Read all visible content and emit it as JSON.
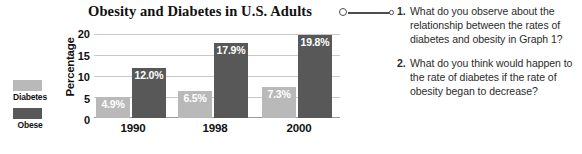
{
  "chart_data": {
    "type": "bar",
    "title": "Obesity and Diabetes in U.S. Adults",
    "xlabel": "",
    "ylabel": "Percentage",
    "ylim": [
      0,
      20
    ],
    "yticks": [
      "20",
      "15",
      "10",
      "5",
      "0"
    ],
    "grid": true,
    "legend_position": "left",
    "categories": [
      "1990",
      "1998",
      "2000"
    ],
    "series": [
      {
        "name": "Diabetes",
        "color": "#b9b9b9",
        "values": [
          4.9,
          6.5,
          7.3
        ],
        "labels": [
          "4.9%",
          "6.5%",
          "7.3%"
        ]
      },
      {
        "name": "Obese",
        "color": "#585858",
        "values": [
          12.0,
          17.9,
          19.8
        ],
        "labels": [
          "12.0%",
          "17.9%",
          "19.8%"
        ]
      }
    ]
  },
  "legend": {
    "items": [
      {
        "label": "Diabetes",
        "color": "#b9b9b9"
      },
      {
        "label": "Obese",
        "color": "#585858"
      }
    ]
  },
  "connector": {
    "icon": "ring-line-dot-connector"
  },
  "questions": [
    {
      "number": "1.",
      "text": "What do you observe about the relationship between the rates of diabetes and obesity in Graph 1?"
    },
    {
      "number": "2.",
      "text": "What do you think would happen to the rate of diabetes if the rate of obesity began to decrease?"
    }
  ]
}
